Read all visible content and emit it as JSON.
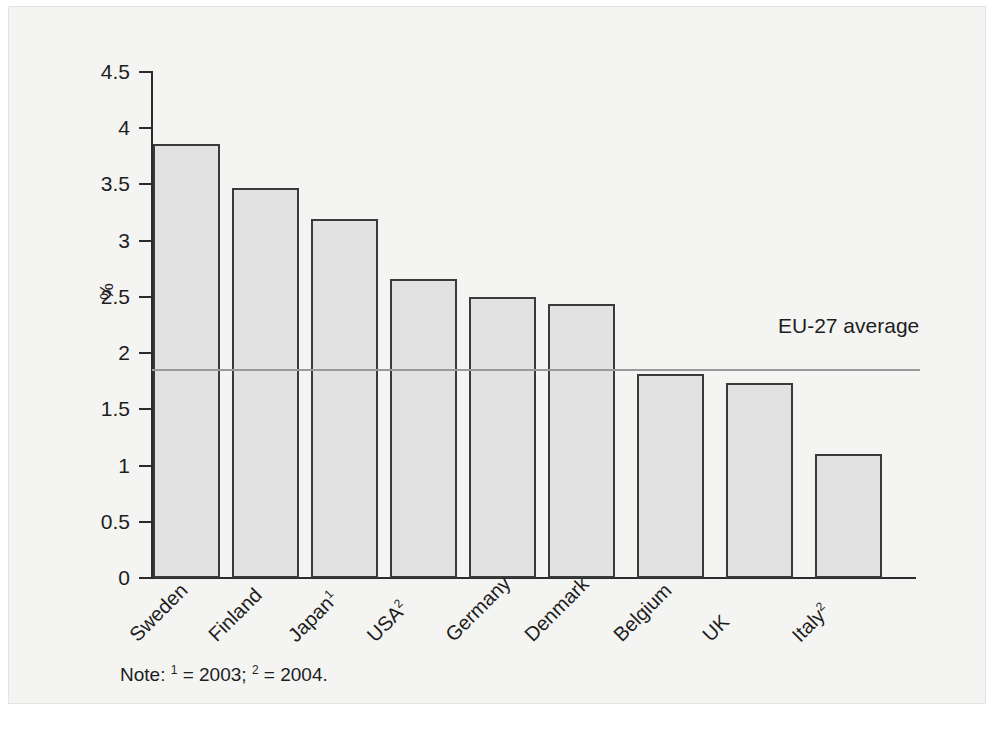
{
  "chart_data": {
    "type": "bar",
    "title": "",
    "subtitle": "",
    "xlabel": "",
    "ylabel": "%",
    "ylim": [
      0,
      4.5
    ],
    "ytick_values": [
      0,
      0.5,
      1,
      1.5,
      2,
      2.5,
      3,
      3.5,
      4,
      4.5
    ],
    "ytick_labels": [
      "0",
      "0.5",
      "1",
      "1.5",
      "2",
      "2.5",
      "3",
      "3.5",
      "4",
      "4.5"
    ],
    "grid": false,
    "legend_position": "none",
    "categories": [
      "Sweden",
      "Finland",
      "Japan",
      "USA",
      "Germany",
      "Denmark",
      "Belgium",
      "UK",
      "Italy"
    ],
    "category_labels": [
      "Sweden",
      "Finland",
      "Japan¹",
      "USA²",
      "Germany",
      "Denmark",
      "Belgium",
      "UK",
      "Italy²"
    ],
    "category_footnote_marks": [
      "",
      "",
      "1",
      "2",
      "",
      "",
      "",
      "",
      "2"
    ],
    "values": [
      3.86,
      3.47,
      3.19,
      2.66,
      2.5,
      2.44,
      1.81,
      1.73,
      1.1
    ],
    "bar_fill_color": "#e2e2e2",
    "bar_edge_color": "#3a3a3a",
    "reference_line": {
      "label": "EU-27 average",
      "value": 1.86,
      "color": "#9a9a9a"
    },
    "annotations": [
      {
        "text": "EU-27 average",
        "kind": "reference-line-label"
      }
    ]
  },
  "note": {
    "prefix": "Note:",
    "mark1": "1",
    "text1": "= 2003;",
    "mark2": "2",
    "text2": "= 2004.",
    "full": "Note: ¹ = 2003; ² = 2004."
  }
}
